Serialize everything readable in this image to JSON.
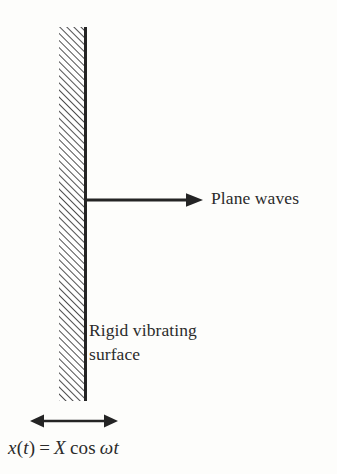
{
  "figure": {
    "kind": "acoustics-schematic",
    "background_color": "#fdfdfb",
    "ink_color": "#2b2b2b",
    "width": 337,
    "height": 474
  },
  "wall": {
    "name": "rigid vibrating surface",
    "hatch_fill": "diagonal-hatch",
    "hatch_angle_deg": 45,
    "face_line_color": "#242424"
  },
  "arrows": {
    "plane_wave": {
      "direction": "right",
      "heads": 1,
      "color": "#242424"
    },
    "displacement": {
      "direction": "both",
      "heads": 2,
      "color": "#242424"
    }
  },
  "labels": {
    "plane_waves": "Plane waves",
    "surface_line1": "Rigid vibrating",
    "surface_line2": "surface"
  },
  "equation": {
    "lhs_var": "x",
    "lhs_open": "(",
    "lhs_arg": "t",
    "lhs_close": ")",
    "equals": "=",
    "amplitude": "X",
    "function": "cos",
    "omega": "ω",
    "time": "t",
    "plain": "x(t) = X cos ωt"
  }
}
